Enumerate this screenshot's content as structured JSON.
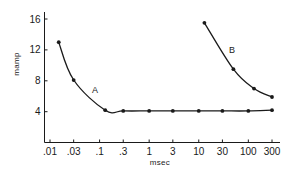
{
  "chart_data": {
    "type": "line",
    "title": "",
    "xlabel": "msec",
    "ylabel": "mamp",
    "xscale": "log",
    "x_ticks": [
      ".01",
      ".03",
      ".1",
      ".3",
      "1",
      "3",
      "10",
      "30",
      "100",
      "300"
    ],
    "x_tick_values": [
      0.01,
      0.03,
      0.1,
      0.3,
      1,
      3,
      10,
      30,
      100,
      300
    ],
    "y_ticks": [
      "4",
      "8",
      "12",
      "16"
    ],
    "y_tick_values": [
      4,
      8,
      12,
      16
    ],
    "ylim": [
      0,
      17
    ],
    "grid": false,
    "legend": "inline labels",
    "series": [
      {
        "name": "A",
        "x": [
          0.015,
          0.03,
          0.13,
          0.3,
          1,
          3,
          10,
          30,
          100,
          300
        ],
        "y": [
          13.0,
          8.1,
          4.2,
          4.1,
          4.1,
          4.1,
          4.1,
          4.1,
          4.1,
          4.2
        ]
      },
      {
        "name": "B",
        "x": [
          13,
          50,
          130,
          300
        ],
        "y": [
          15.5,
          9.5,
          7.0,
          5.9
        ]
      }
    ],
    "colors": {
      "line": "#1a1a1a",
      "marker": "#1a1a1a",
      "background": "#ffffff"
    }
  }
}
